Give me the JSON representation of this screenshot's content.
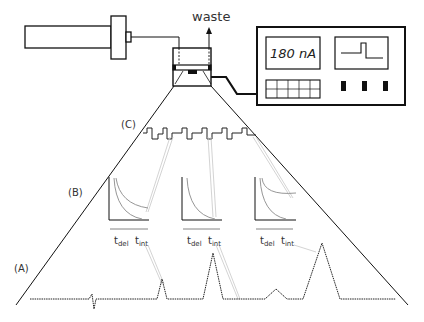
{
  "labels": {
    "waste": "waste",
    "display_value": "180 nA",
    "panel_c": "(C)",
    "panel_b": "(B)",
    "panel_a": "(A)",
    "t_del": "t",
    "t_del_sub": "del",
    "t_int": "t",
    "t_int_sub": "int"
  },
  "colors": {
    "stroke": "#111111",
    "gray_curve": "#8a8a8a",
    "guide": "#c4c4c4",
    "text": "#333333"
  },
  "components": {
    "pump": "syringe-pump",
    "cell": "flow-cell",
    "instrument": "potentiostat"
  },
  "chromatogram_peaks": [
    {
      "x": 162,
      "height": 28
    },
    {
      "x": 213,
      "height": 58
    },
    {
      "x": 276,
      "height": 14
    },
    {
      "x": 322,
      "height": 68
    }
  ],
  "waveform_pulses": 6,
  "decay_panels": [
    {
      "x": 110,
      "label_del": "t",
      "label_int": "t"
    },
    {
      "x": 183,
      "label_del": "t",
      "label_int": "t"
    },
    {
      "x": 256,
      "label_del": "t",
      "label_int": "t"
    }
  ]
}
